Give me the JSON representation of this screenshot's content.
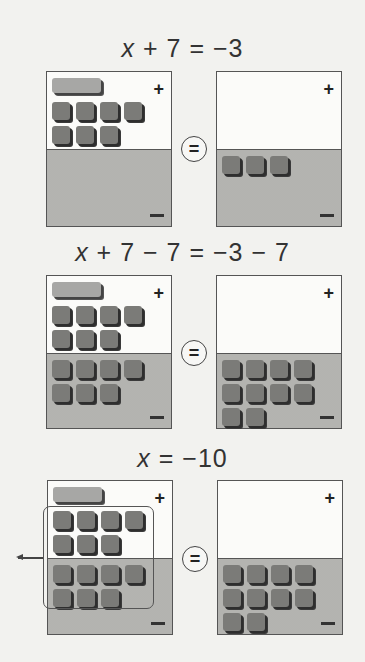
{
  "steps": [
    {
      "equation": {
        "lhs_var": "x",
        "rest": " + 7 = −3",
        "full": "x + 7 = −3"
      },
      "left_mat": {
        "x_tiles_positive": 1,
        "unit_tiles_positive": 7,
        "unit_tiles_negative": 0
      },
      "right_mat": {
        "x_tiles_positive": 0,
        "unit_tiles_positive": 0,
        "unit_tiles_negative": 3
      }
    },
    {
      "equation": {
        "lhs_var": "x",
        "rest": " + 7 − 7 = −3 − 7",
        "full": "x + 7 − 7 = −3 − 7"
      },
      "left_mat": {
        "x_tiles_positive": 1,
        "unit_tiles_positive": 7,
        "unit_tiles_negative": 7
      },
      "right_mat": {
        "x_tiles_positive": 0,
        "unit_tiles_positive": 0,
        "unit_tiles_negative": 10
      }
    },
    {
      "equation": {
        "lhs_var": "x",
        "rest": " = −10",
        "full": "x = −10"
      },
      "left_mat": {
        "x_tiles_positive": 1,
        "unit_tiles_positive": 7,
        "unit_tiles_negative": 7,
        "zero_pairs_removed": true
      },
      "right_mat": {
        "x_tiles_positive": 0,
        "unit_tiles_positive": 0,
        "unit_tiles_negative": 10
      }
    }
  ],
  "labels": {
    "plus": "+",
    "equals": "="
  },
  "colors": {
    "background": "#f2f2ef",
    "positive_region": "#fbfbf9",
    "negative_region": "#c9c9c6",
    "tile": "#6d6d6b",
    "x_tile": "#9a9a98",
    "border": "#555555"
  }
}
